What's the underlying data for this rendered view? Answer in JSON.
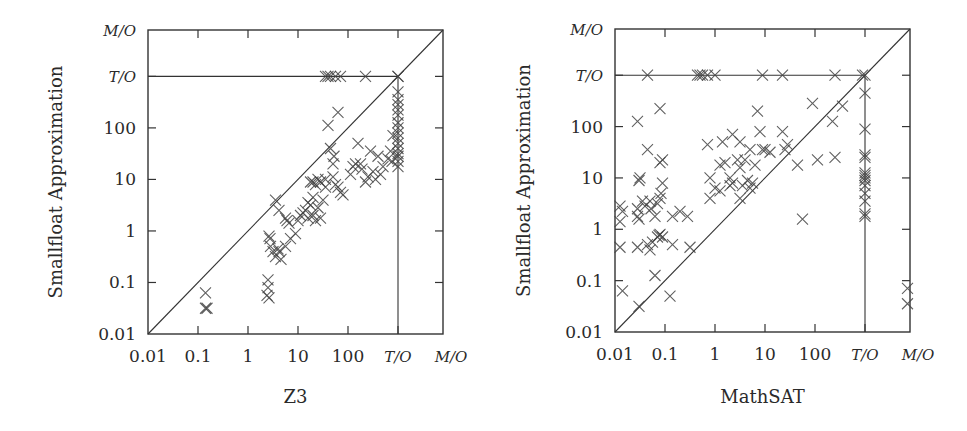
{
  "chart_data": [
    {
      "type": "scatter",
      "title": "",
      "xlabel": "Z3",
      "ylabel": "Smallfloat Approximation",
      "scale": "log",
      "note": "values are log10(seconds); T/O plotted at 3, M/O at 3.9",
      "xlim": [
        -2,
        3.9
      ],
      "ylim": [
        -2,
        3.9
      ],
      "x_ticks": [
        {
          "label": "0.01",
          "v": -2
        },
        {
          "label": "0.1",
          "v": -1
        },
        {
          "label": "1",
          "v": 0
        },
        {
          "label": "10",
          "v": 1
        },
        {
          "label": "100",
          "v": 2
        },
        {
          "label": "T/O",
          "v": 3
        },
        {
          "label": "M/O",
          "v": 3.9
        }
      ],
      "y_ticks": [
        {
          "label": "0.01",
          "v": -2
        },
        {
          "label": "0.1",
          "v": -1
        },
        {
          "label": "1",
          "v": 0
        },
        {
          "label": "10",
          "v": 1
        },
        {
          "label": "100",
          "v": 2
        },
        {
          "label": "T/O",
          "v": 3
        },
        {
          "label": "M/O",
          "v": 3.9
        }
      ],
      "reference_lines": [
        "diagonal y=x",
        "horizontal at T/O",
        "vertical at T/O"
      ],
      "points": [
        [
          -0.85,
          -1.2
        ],
        [
          -0.85,
          -1.5
        ],
        [
          -0.82,
          -1.5
        ],
        [
          0.4,
          -0.95
        ],
        [
          0.4,
          -1.1
        ],
        [
          0.38,
          -1.25
        ],
        [
          0.42,
          -1.3
        ],
        [
          0.42,
          -0.1
        ],
        [
          0.44,
          -0.15
        ],
        [
          0.45,
          -0.3
        ],
        [
          0.5,
          -0.4
        ],
        [
          0.55,
          -0.5
        ],
        [
          0.6,
          -0.35
        ],
        [
          0.62,
          -0.4
        ],
        [
          0.66,
          -0.55
        ],
        [
          0.75,
          -0.3
        ],
        [
          0.85,
          -0.15
        ],
        [
          0.95,
          -0.05
        ],
        [
          0.55,
          0.6
        ],
        [
          0.62,
          0.4
        ],
        [
          0.75,
          0.25
        ],
        [
          0.78,
          0.2
        ],
        [
          0.82,
          0.15
        ],
        [
          1.0,
          0.2
        ],
        [
          1.05,
          0.3
        ],
        [
          1.1,
          0.35
        ],
        [
          1.15,
          0.4
        ],
        [
          1.2,
          0.55
        ],
        [
          1.2,
          0.25
        ],
        [
          1.25,
          0.5
        ],
        [
          1.3,
          0.3
        ],
        [
          1.3,
          0.65
        ],
        [
          1.35,
          0.2
        ],
        [
          1.4,
          0.45
        ],
        [
          1.45,
          0.25
        ],
        [
          1.5,
          0.6
        ],
        [
          1.25,
          0.95
        ],
        [
          1.3,
          0.95
        ],
        [
          1.35,
          0.9
        ],
        [
          1.4,
          1.0
        ],
        [
          1.45,
          0.95
        ],
        [
          1.55,
          1.0
        ],
        [
          1.55,
          0.85
        ],
        [
          1.7,
          1.05
        ],
        [
          1.75,
          0.9
        ],
        [
          1.8,
          0.85
        ],
        [
          1.85,
          0.75
        ],
        [
          1.9,
          0.7
        ],
        [
          1.65,
          1.6
        ],
        [
          1.7,
          1.3
        ],
        [
          1.72,
          1.45
        ],
        [
          1.6,
          2.05
        ],
        [
          1.8,
          2.3
        ],
        [
          2.05,
          1.1
        ],
        [
          2.1,
          1.25
        ],
        [
          2.15,
          1.3
        ],
        [
          2.2,
          1.7
        ],
        [
          2.25,
          1.3
        ],
        [
          2.28,
          1.2
        ],
        [
          2.35,
          0.95
        ],
        [
          2.4,
          1.05
        ],
        [
          2.45,
          1.55
        ],
        [
          2.5,
          1.15
        ],
        [
          2.55,
          1.0
        ],
        [
          2.6,
          1.45
        ],
        [
          2.65,
          1.1
        ],
        [
          2.7,
          1.25
        ],
        [
          2.8,
          1.4
        ],
        [
          2.85,
          1.55
        ],
        [
          2.9,
          1.85
        ],
        [
          2.88,
          1.35
        ],
        [
          1.55,
          3
        ],
        [
          1.6,
          3
        ],
        [
          1.65,
          3
        ],
        [
          1.75,
          3
        ],
        [
          1.85,
          3
        ],
        [
          2.35,
          3
        ],
        [
          3,
          3
        ],
        [
          3,
          3
        ],
        [
          3,
          2.7
        ],
        [
          3,
          2.55
        ],
        [
          3,
          2.45
        ],
        [
          3,
          2.35
        ],
        [
          3,
          2.25
        ],
        [
          3,
          2.1
        ],
        [
          3,
          2.0
        ],
        [
          3,
          1.9
        ],
        [
          3,
          1.8
        ],
        [
          3,
          1.7
        ],
        [
          3,
          1.6
        ],
        [
          3,
          1.5
        ],
        [
          3,
          1.45
        ],
        [
          3,
          1.35
        ],
        [
          3,
          1.25
        ]
      ]
    },
    {
      "type": "scatter",
      "title": "",
      "xlabel": "MathSAT",
      "ylabel": "Smallfloat Approximation",
      "scale": "log",
      "note": "values are log10(seconds); T/O plotted at 3, M/O at 3.9",
      "xlim": [
        -2,
        3.9
      ],
      "ylim": [
        -2,
        3.9
      ],
      "x_ticks": [
        {
          "label": "0.01",
          "v": -2
        },
        {
          "label": "0.1",
          "v": -1
        },
        {
          "label": "1",
          "v": 0
        },
        {
          "label": "10",
          "v": 1
        },
        {
          "label": "100",
          "v": 2
        },
        {
          "label": "T/O",
          "v": 3
        },
        {
          "label": "M/O",
          "v": 3.9
        }
      ],
      "y_ticks": [
        {
          "label": "0.01",
          "v": -2
        },
        {
          "label": "0.1",
          "v": -1
        },
        {
          "label": "1",
          "v": 0
        },
        {
          "label": "10",
          "v": 1
        },
        {
          "label": "100",
          "v": 2
        },
        {
          "label": "T/O",
          "v": 3
        },
        {
          "label": "M/O",
          "v": 3.9
        }
      ],
      "reference_lines": [
        "diagonal y=x",
        "horizontal at T/O",
        "vertical at T/O"
      ],
      "points": [
        [
          -1.35,
          3
        ],
        [
          -0.35,
          3
        ],
        [
          -0.3,
          3
        ],
        [
          -0.25,
          3
        ],
        [
          -0.15,
          3
        ],
        [
          0,
          3
        ],
        [
          0.95,
          3
        ],
        [
          1.35,
          3
        ],
        [
          2.4,
          3
        ],
        [
          2.95,
          3
        ],
        [
          3,
          3
        ],
        [
          -1.55,
          2.1
        ],
        [
          -1.1,
          2.35
        ],
        [
          -1.35,
          1.55
        ],
        [
          -1.05,
          1.35
        ],
        [
          -1.1,
          1.3
        ],
        [
          -1.5,
          1.0
        ],
        [
          -1.52,
          0.95
        ],
        [
          -1.05,
          0.9
        ],
        [
          -1.08,
          0.7
        ],
        [
          -1.15,
          0.5
        ],
        [
          -1.9,
          0.45
        ],
        [
          -1.85,
          0.35
        ],
        [
          -1.55,
          0.4
        ],
        [
          -1.45,
          0.55
        ],
        [
          -1.4,
          0.45
        ],
        [
          -1.3,
          0.55
        ],
        [
          -1.28,
          0.4
        ],
        [
          -1.1,
          0.6
        ],
        [
          -1.9,
          0.15
        ],
        [
          -1.55,
          0.25
        ],
        [
          -1.52,
          0.2
        ],
        [
          -1.2,
          0.25
        ],
        [
          -0.85,
          0.25
        ],
        [
          -0.7,
          0.35
        ],
        [
          -0.55,
          0.25
        ],
        [
          -1.9,
          -0.35
        ],
        [
          -1.55,
          -0.35
        ],
        [
          -1.35,
          -0.3
        ],
        [
          -1.3,
          -0.4
        ],
        [
          -1.25,
          -0.25
        ],
        [
          -1.15,
          -0.15
        ],
        [
          -1.12,
          -0.12
        ],
        [
          -1.1,
          -0.1
        ],
        [
          -1.05,
          -0.15
        ],
        [
          -0.85,
          -0.3
        ],
        [
          -0.5,
          -0.35
        ],
        [
          -1.85,
          -1.2
        ],
        [
          -1.2,
          -0.9
        ],
        [
          -0.9,
          -1.3
        ],
        [
          -1.52,
          -1.5
        ],
        [
          -0.15,
          1.65
        ],
        [
          0.15,
          1.7
        ],
        [
          0.35,
          1.85
        ],
        [
          0.5,
          1.7
        ],
        [
          0.7,
          1.55
        ],
        [
          0.9,
          1.9
        ],
        [
          0.95,
          1.55
        ],
        [
          1.35,
          1.9
        ],
        [
          1.4,
          1.55
        ],
        [
          1.45,
          1.65
        ],
        [
          -0.1,
          1.0
        ],
        [
          0,
          0.8
        ],
        [
          0.1,
          1.25
        ],
        [
          0.2,
          1.3
        ],
        [
          0.3,
          1.0
        ],
        [
          0.35,
          0.9
        ],
        [
          0.45,
          1.35
        ],
        [
          0.5,
          1.2
        ],
        [
          0.55,
          0.85
        ],
        [
          0.6,
          1.35
        ],
        [
          0.65,
          0.95
        ],
        [
          0.75,
          0.9
        ],
        [
          0.8,
          1.25
        ],
        [
          1.0,
          1.55
        ],
        [
          1.1,
          1.5
        ],
        [
          -0.1,
          0.6
        ],
        [
          0.1,
          0.75
        ],
        [
          0.3,
          0.85
        ],
        [
          0.5,
          0.6
        ],
        [
          0.7,
          0.8
        ],
        [
          0.85,
          2.3
        ],
        [
          1.65,
          1.25
        ],
        [
          1.95,
          2.45
        ],
        [
          2.35,
          2.1
        ],
        [
          2.55,
          2.4
        ],
        [
          2.4,
          1.4
        ],
        [
          2.05,
          1.35
        ],
        [
          1.75,
          0.2
        ],
        [
          3,
          2.65
        ],
        [
          3,
          1.95
        ],
        [
          3,
          1.45
        ],
        [
          3,
          1.4
        ],
        [
          3,
          1.1
        ],
        [
          3,
          1.05
        ],
        [
          3,
          1.0
        ],
        [
          3,
          0.95
        ],
        [
          3,
          0.85
        ],
        [
          3,
          0.7
        ],
        [
          3,
          0.55
        ],
        [
          3,
          0.3
        ],
        [
          3,
          0.25
        ],
        [
          3.85,
          -1.15
        ],
        [
          3.85,
          -1.45
        ]
      ]
    }
  ],
  "figure": {
    "left_panel": {
      "xlabel": "Z3",
      "ylabel": "Smallfloat Approximation"
    },
    "right_panel": {
      "xlabel": "MathSAT",
      "ylabel": "Smallfloat Approximation"
    }
  }
}
